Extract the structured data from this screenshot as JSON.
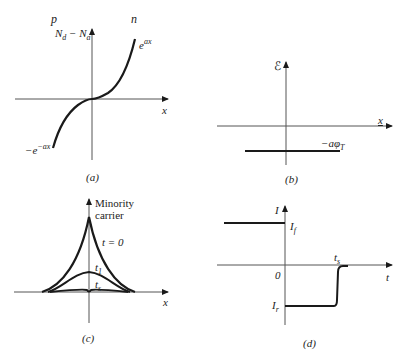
{
  "figure": {
    "panels": [
      {
        "id": "a",
        "caption": "(a)",
        "region_left_label": "p",
        "region_right_label": "n",
        "y_axis_label": "N_d − N_a",
        "x_axis_label": "x",
        "curve_label_positive": "e^{ax}",
        "curve_label_negative": "−e^{−ax}"
      },
      {
        "id": "b",
        "caption": "(b)",
        "y_axis_label": "ℰ",
        "x_axis_label": "x",
        "level_label": "−aφ_T"
      },
      {
        "id": "c",
        "caption": "(c)",
        "y_axis_label_line1": "Minority",
        "y_axis_label_line2": "carrier",
        "x_axis_label": "x",
        "curve_labels": [
          "t = 0",
          "t₁",
          "tₛ"
        ]
      },
      {
        "id": "d",
        "caption": "(d)",
        "y_axis_label": "I",
        "x_axis_label": "t",
        "origin_label": "0",
        "forward_current_label": "I_f",
        "reverse_current_label": "I_r",
        "storage_time_label": "tₛ"
      }
    ]
  },
  "text": {
    "a_p": "p",
    "a_n": "n",
    "a_ylabel_main": "N",
    "a_ylabel_sub1": "d",
    "a_ylabel_mid": " − N",
    "a_ylabel_sub2": "a",
    "a_pos_base": "e",
    "a_pos_sup": "ax",
    "a_neg_base": "−e",
    "a_neg_sup": "−ax",
    "a_x": "x",
    "a_cap": "(a)",
    "b_y": "ℰ",
    "b_x": "x",
    "b_level_base": "−aφ",
    "b_level_sub": "T",
    "b_cap": "(b)",
    "c_y1": "Minority",
    "c_y2": "carrier",
    "c_t0": "t = 0",
    "c_t1_base": "t",
    "c_t1_sub": "1",
    "c_ts_base": "t",
    "c_ts_sub": "s",
    "c_x": "x",
    "c_cap": "(c)",
    "d_y": "I",
    "d_if_base": "I",
    "d_if_sub": "f",
    "d_ir_base": "I",
    "d_ir_sub": "r",
    "d_zero": "0",
    "d_ts_base": "t",
    "d_ts_sub": "s",
    "d_t": "t",
    "d_cap": "(d)"
  },
  "colors": {
    "ink": "#1a1a1a",
    "axis": "#555555",
    "background": "#ffffff"
  }
}
